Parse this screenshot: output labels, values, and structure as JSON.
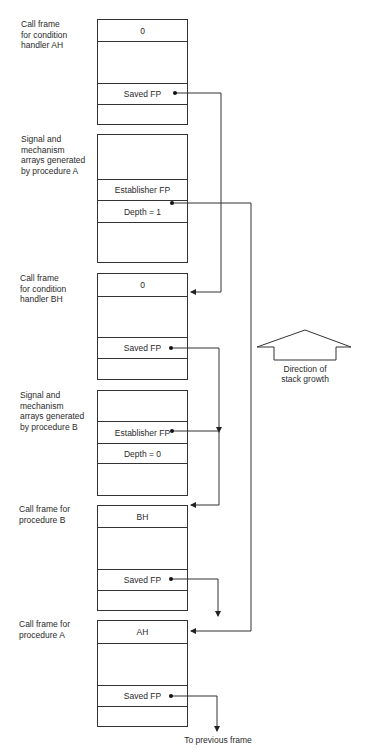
{
  "frames": [
    {
      "label": "Call frame\nfor condition\nhandler AH",
      "cells": [
        "0",
        "",
        "Saved FP",
        ""
      ]
    },
    {
      "label": "Signal and\nmechanism\narrays generated\nby procedure A",
      "cells": [
        "",
        "Establisher FP",
        "Depth = 1",
        ""
      ]
    },
    {
      "label": "Call frame\nfor condition\nhandler BH",
      "cells": [
        "0",
        "",
        "Saved FP",
        ""
      ]
    },
    {
      "label": "Signal and\nmechanism\narrays generated\nby procedure B",
      "cells": [
        "",
        "Establisher FP",
        "Depth = 0",
        ""
      ]
    },
    {
      "label": "Call frame for\nprocedure B",
      "cells": [
        "BH",
        "",
        "Saved FP",
        ""
      ]
    },
    {
      "label": "Call frame for\nprocedure A",
      "cells": [
        "AH",
        "",
        "Saved FP",
        ""
      ]
    }
  ],
  "stack_growth": {
    "icon": "up-arrow-outline",
    "caption": "Direction of\nstack growth"
  },
  "footer": {
    "to_previous": "To previous frame"
  }
}
